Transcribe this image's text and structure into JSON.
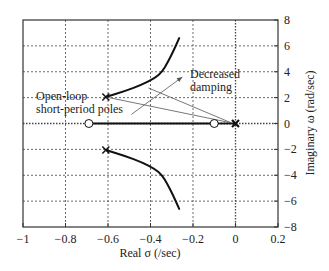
{
  "chart_data": {
    "type": "scatter",
    "title": "",
    "subtype": "root-locus",
    "xlabel": "Real σ (/sec)",
    "ylabel": "Imaginary ω (rad/sec)",
    "xlim": [
      -1,
      0.2
    ],
    "ylim": [
      -8,
      8
    ],
    "xticks": [
      -1,
      -0.8,
      -0.6,
      -0.4,
      -0.2,
      0,
      0.2
    ],
    "xtick_labels": [
      "−1",
      "−0.8",
      "−0.6",
      "−0.4",
      "−0.2",
      "0",
      "0.2"
    ],
    "yticks": [
      8,
      6,
      4,
      2,
      0,
      -2,
      -4,
      -6,
      -8
    ],
    "ytick_labels": [
      "8",
      "6",
      "4",
      "2",
      "0",
      "−2",
      "−4",
      "−6",
      "−8"
    ],
    "y_axis_side": "right",
    "grid": true,
    "grid_style": "dotted",
    "poles": [
      {
        "sigma": -0.61,
        "omega": 2.05,
        "marker": "x"
      },
      {
        "sigma": -0.61,
        "omega": -2.05,
        "marker": "x"
      },
      {
        "sigma": 0.0,
        "omega": 0.0,
        "marker": "x",
        "note": "double pole at origin"
      }
    ],
    "zeros": [
      {
        "sigma": -0.69,
        "omega": 0.0,
        "marker": "o"
      },
      {
        "sigma": -0.1,
        "omega": 0.0,
        "marker": "o"
      }
    ],
    "series": [
      {
        "name": "upper-branch",
        "points": [
          [
            -0.61,
            2.05
          ],
          [
            -0.52,
            2.5
          ],
          [
            -0.44,
            3.0
          ],
          [
            -0.38,
            3.5
          ],
          [
            -0.345,
            4.0
          ],
          [
            -0.32,
            4.7
          ],
          [
            -0.295,
            5.5
          ],
          [
            -0.265,
            6.6
          ]
        ]
      },
      {
        "name": "lower-branch",
        "points": [
          [
            -0.61,
            -2.05
          ],
          [
            -0.52,
            -2.5
          ],
          [
            -0.44,
            -3.0
          ],
          [
            -0.38,
            -3.5
          ],
          [
            -0.345,
            -4.0
          ],
          [
            -0.32,
            -4.7
          ],
          [
            -0.295,
            -5.5
          ],
          [
            -0.265,
            -6.6
          ]
        ]
      },
      {
        "name": "real-axis-branch",
        "points": [
          [
            -0.69,
            0.0
          ],
          [
            -0.1,
            0.0
          ]
        ]
      },
      {
        "name": "real-axis-dotted-segment",
        "style": "dotted",
        "points": [
          [
            -0.1,
            0.0
          ],
          [
            0.0,
            0.0
          ]
        ]
      }
    ],
    "annotations": [
      {
        "text": "Open-loop\nshort-period poles",
        "lines": [
          "Open-loop",
          "short-period poles"
        ],
        "leader_lines": [
          {
            "from": [
              -0.61,
              2.05
            ],
            "to": [
              -0.02,
              0.05
            ]
          }
        ]
      },
      {
        "text": "Decreased\ndamping",
        "lines": [
          "Decreased",
          "damping"
        ],
        "arrow": {
          "from": [
            -0.49,
            0.7
          ],
          "to": [
            -0.25,
            3.6
          ]
        },
        "leader_lines": [
          {
            "from": [
              -0.41,
              2.75
            ],
            "to": [
              -0.02,
              0.05
            ]
          }
        ]
      }
    ]
  },
  "labels": {
    "xlabel": "Real σ (/sec)",
    "ylabel": "Imaginary ω (rad/sec)",
    "annotation_poles_line1": "Open-loop",
    "annotation_poles_line2": "short-period poles",
    "annotation_damping_line1": "Decreased",
    "annotation_damping_line2": "damping"
  },
  "colors": {
    "frame": "#333333",
    "grid": "#444444",
    "locus": "#111111",
    "annotation_line": "#555555",
    "text": "#222222"
  }
}
